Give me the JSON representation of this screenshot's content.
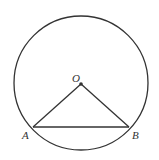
{
  "diagram": {
    "type": "geometry",
    "stroke_color": "#333333",
    "background": "#ffffff",
    "circle": {
      "center_label": "O",
      "cx": 81,
      "cy": 83,
      "r": 67
    },
    "points": [
      {
        "label": "O",
        "x": 81,
        "y": 84,
        "label_x": 72,
        "label_y": 82
      },
      {
        "label": "A",
        "x": 33,
        "y": 127,
        "label_x": 22,
        "label_y": 139
      },
      {
        "label": "B",
        "x": 129,
        "y": 127,
        "label_x": 132,
        "label_y": 139
      }
    ],
    "segments": [
      {
        "name": "OA",
        "from": "O",
        "to": "A"
      },
      {
        "name": "OB",
        "from": "O",
        "to": "B"
      },
      {
        "name": "AB",
        "from": "A",
        "to": "B"
      }
    ]
  }
}
